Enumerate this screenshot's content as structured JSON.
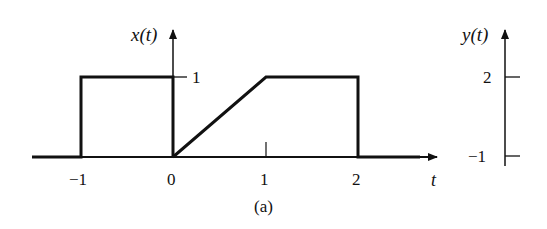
{
  "figure": {
    "caption": "(a)",
    "x_plot": {
      "axis_label": "x(t)",
      "time_label": "t",
      "x_ticks": [
        "−1",
        "0",
        "1",
        "2"
      ],
      "level_tick_label": "1",
      "signal_x_points": [
        [
          -1.6,
          0
        ],
        [
          -1,
          0
        ],
        [
          -1,
          1
        ],
        [
          0,
          1
        ],
        [
          0,
          0
        ]
      ],
      "signal_ramp_points": [
        [
          0,
          0
        ],
        [
          1,
          1
        ],
        [
          2,
          1
        ],
        [
          2,
          0
        ],
        [
          2.85,
          0
        ]
      ]
    },
    "y_plot": {
      "axis_label": "y(t)",
      "ticks": [
        "2",
        "−1"
      ]
    }
  },
  "colors": {
    "ink": "#111111",
    "background": "#ffffff"
  }
}
